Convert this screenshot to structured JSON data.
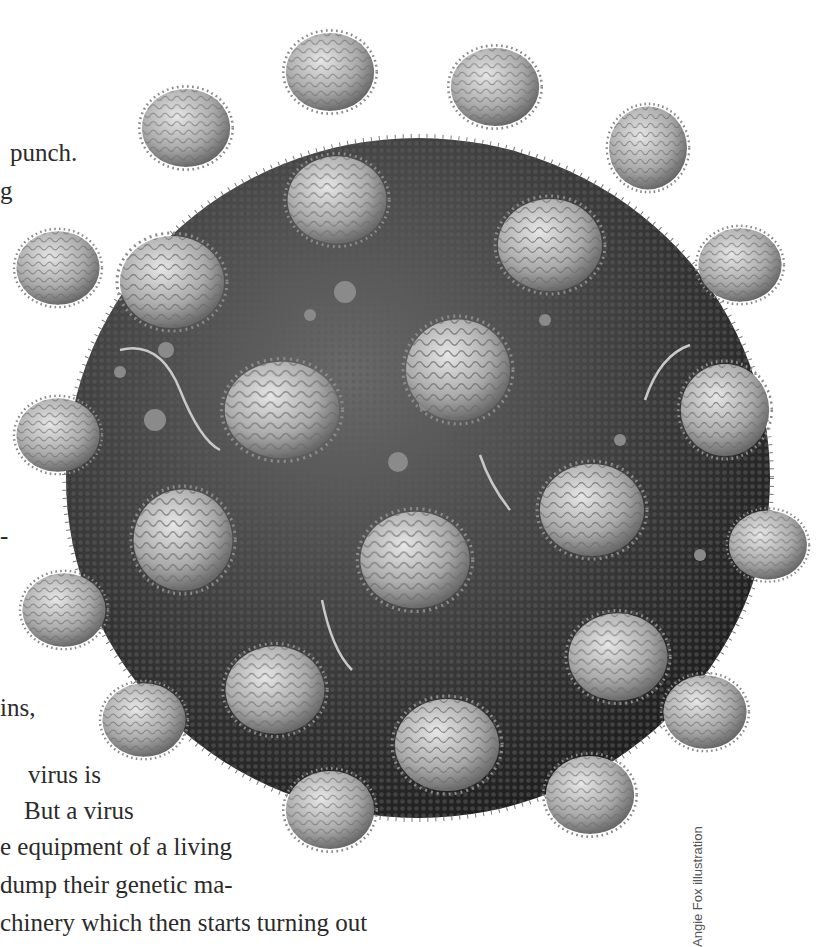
{
  "body_text_fragments": [
    {
      "text": "punch.",
      "x": 10,
      "y": 152
    },
    {
      "text": "g",
      "x": 0,
      "y": 190
    },
    {
      "text": "-",
      "x": 0,
      "y": 525
    },
    {
      "text": "ins,",
      "x": 0,
      "y": 697
    },
    {
      "text": "virus is",
      "x": 28,
      "y": 780
    },
    {
      "text": "But a virus",
      "x": 24,
      "y": 816
    },
    {
      "text": "e equipment of a living",
      "x": 0,
      "y": 852
    },
    {
      "text": "dump their genetic ma-",
      "x": 0,
      "y": 888
    },
    {
      "text": "chinery which then starts turning out",
      "x": 0,
      "y": 925
    }
  ],
  "illustration": {
    "subject": "virus-particle-illustration",
    "core_color": "#3a3a3a",
    "core_highlight": "#6a6a6a",
    "spike_color": "#b8b8b8",
    "spike_shadow": "#6f6f6f"
  },
  "credit": {
    "text": "Angie Fox illustration"
  }
}
